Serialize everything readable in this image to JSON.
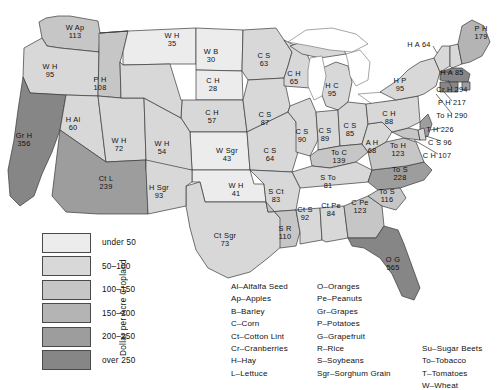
{
  "title": "Dollar per Acre Cropland",
  "legend": {
    "axis_label": "Dollar per Acre Cropland",
    "classes": [
      {
        "label": "under 50",
        "color": "#ececec"
      },
      {
        "label": "50–100",
        "color": "#d8d8d8"
      },
      {
        "label": "100–150",
        "color": "#c6c6c6"
      },
      {
        "label": "150–200",
        "color": "#b4b4b4"
      },
      {
        "label": "200–250",
        "color": "#9d9d9d"
      },
      {
        "label": "over 250",
        "color": "#868686"
      }
    ]
  },
  "crop_key": {
    "column1": [
      "Al–Alfalfa Seed",
      "Ap–Apples",
      "B–Barley",
      "C–Corn",
      "Ct–Cotton Lint",
      "Cr–Cranberries",
      "H–Hay",
      "L–Lettuce"
    ],
    "column2": [
      "O–Oranges",
      "Pe–Peanuts",
      "Gr–Grapes",
      "P–Potatoes",
      "G–Grapefruit",
      "R–Rice",
      "S–Soybeans",
      "Sgr–Sorghum Grain"
    ],
    "column3": [
      "Su–Sugar Beets",
      "To–Tobacco",
      "T–Tomatoes",
      "W–Wheat"
    ]
  },
  "chart_data": {
    "type": "map",
    "title": "Dollar per Acre Cropland",
    "value_unit": "dollars per acre of cropland",
    "classes": [
      "under 50",
      "50-100",
      "100-150",
      "150-200",
      "200-250",
      "over 250"
    ],
    "states": [
      {
        "state": "Washington",
        "crops": "W Ap",
        "value": 113,
        "class": 2,
        "x": 75,
        "y": 32
      },
      {
        "state": "Oregon",
        "crops": "W H",
        "value": 95,
        "class": 1,
        "x": 50,
        "y": 71
      },
      {
        "state": "Idaho",
        "crops": "P H",
        "value": 108,
        "class": 2,
        "x": 100,
        "y": 84
      },
      {
        "state": "Montana",
        "crops": "W H",
        "value": 35,
        "class": 0,
        "x": 172,
        "y": 40
      },
      {
        "state": "North Dakota",
        "crops": "W B",
        "value": 30,
        "class": 0,
        "x": 211,
        "y": 56
      },
      {
        "state": "South Dakota",
        "crops": "C H",
        "value": 28,
        "class": 0,
        "x": 213,
        "y": 85
      },
      {
        "state": "Nebraska",
        "crops": "C H",
        "value": 57,
        "class": 1,
        "x": 212,
        "y": 117
      },
      {
        "state": "Kansas",
        "crops": "W Sgr",
        "value": 43,
        "class": 0,
        "x": 227,
        "y": 155
      },
      {
        "state": "Oklahoma",
        "crops": "W H",
        "value": 41,
        "class": 0,
        "x": 236,
        "y": 190
      },
      {
        "state": "Texas",
        "crops": "Ct Sgr",
        "value": 73,
        "class": 1,
        "x": 225,
        "y": 240
      },
      {
        "state": "Minnesota",
        "crops": "C S",
        "value": 63,
        "class": 1,
        "x": 264,
        "y": 60
      },
      {
        "state": "Iowa",
        "crops": "C S",
        "value": 87,
        "class": 1,
        "x": 265,
        "y": 119
      },
      {
        "state": "Missouri",
        "crops": "C S",
        "value": 64,
        "class": 1,
        "x": 270,
        "y": 155
      },
      {
        "state": "Arkansas",
        "crops": "S Ct",
        "value": 83,
        "class": 1,
        "x": 276,
        "y": 196
      },
      {
        "state": "Louisiana",
        "crops": "S R",
        "value": 110,
        "class": 2,
        "x": 285,
        "y": 233
      },
      {
        "state": "Mississippi",
        "crops": "Ct S",
        "value": 92,
        "class": 1,
        "x": 305,
        "y": 214
      },
      {
        "state": "Alabama",
        "crops": "Ct Pe",
        "value": 84,
        "class": 1,
        "x": 331,
        "y": 210
      },
      {
        "state": "Georgia",
        "crops": "C Pe",
        "value": 123,
        "class": 2,
        "x": 360,
        "y": 207
      },
      {
        "state": "Florida",
        "crops": "O G",
        "value": 565,
        "class": 5,
        "x": 393,
        "y": 264
      },
      {
        "state": "Wisconsin",
        "crops": "C H",
        "value": 65,
        "class": 1,
        "x": 294,
        "y": 78
      },
      {
        "state": "Michigan",
        "crops": "H C",
        "value": 95,
        "class": 1,
        "x": 332,
        "y": 90
      },
      {
        "state": "Illinois",
        "crops": "C S",
        "value": 90,
        "class": 1,
        "x": 302,
        "y": 136
      },
      {
        "state": "Indiana",
        "crops": "C S",
        "value": 89,
        "class": 1,
        "x": 325,
        "y": 135
      },
      {
        "state": "Ohio",
        "crops": "C S",
        "value": 85,
        "class": 1,
        "x": 350,
        "y": 130
      },
      {
        "state": "Kentucky",
        "crops": "To C",
        "value": 139,
        "class": 2,
        "x": 339,
        "y": 157
      },
      {
        "state": "Tennessee",
        "crops": "S To",
        "value": 81,
        "class": 1,
        "x": 328,
        "y": 182
      },
      {
        "state": "West Virginia",
        "crops": "A H",
        "value": 68,
        "class": 1,
        "x": 372,
        "y": 147
      },
      {
        "state": "Virginia",
        "crops": "To H",
        "value": 123,
        "class": 2,
        "x": 398,
        "y": 150
      },
      {
        "state": "North Carolina",
        "crops": "To S",
        "value": 228,
        "class": 4,
        "x": 400,
        "y": 174
      },
      {
        "state": "South Carolina",
        "crops": "To S",
        "value": 116,
        "class": 2,
        "x": 387,
        "y": 196
      },
      {
        "state": "Pennsylvania",
        "crops": "C H",
        "value": 88,
        "class": 1,
        "x": 389,
        "y": 118
      },
      {
        "state": "New York",
        "crops": "H P",
        "value": 95,
        "class": 1,
        "x": 400,
        "y": 85
      },
      {
        "state": "California",
        "crops": "Gr H",
        "value": 356,
        "class": 5,
        "x": 24,
        "y": 140
      },
      {
        "state": "Nevada",
        "crops": "H Al",
        "value": 60,
        "class": 1,
        "x": 73,
        "y": 124
      },
      {
        "state": "Utah",
        "crops": "W H",
        "value": 72,
        "class": 1,
        "x": 119,
        "y": 145
      },
      {
        "state": "Arizona",
        "crops": "Ct L",
        "value": 239,
        "class": 4,
        "x": 106,
        "y": 183
      },
      {
        "state": "New Mexico",
        "crops": "H Sgr",
        "value": 93,
        "class": 1,
        "x": 159,
        "y": 192
      },
      {
        "state": "Colorado",
        "crops": "W H",
        "value": 54,
        "class": 1,
        "x": 162,
        "y": 148
      }
    ],
    "callouts": [
      {
        "state": "Vermont",
        "crops": "H A",
        "value": 64,
        "class": 1,
        "x": 419,
        "y": 45,
        "align": "right"
      },
      {
        "state": "Maine",
        "crops": "P H",
        "value": 179,
        "class": 3,
        "x": 481,
        "y": 33,
        "align": "center"
      },
      {
        "state": "New Hampshire",
        "crops": "H A",
        "value": 85,
        "class": 1,
        "x": 452,
        "y": 73,
        "align": "left"
      },
      {
        "state": "Massachusetts",
        "crops": "Cr H",
        "value": 294,
        "class": 5,
        "x": 452,
        "y": 90,
        "align": "left"
      },
      {
        "state": "Rhode Island",
        "crops": "P H",
        "value": 217,
        "class": 4,
        "x": 452,
        "y": 103,
        "align": "left"
      },
      {
        "state": "Connecticut",
        "crops": "To H",
        "value": 290,
        "class": 5,
        "x": 452,
        "y": 116,
        "align": "left"
      },
      {
        "state": "New Jersey",
        "crops": "T H",
        "value": 226,
        "class": 4,
        "x": 440,
        "y": 130,
        "align": "left"
      },
      {
        "state": "Delaware",
        "crops": "C S",
        "value": 96,
        "class": 1,
        "x": 440,
        "y": 143,
        "align": "left"
      },
      {
        "state": "Maryland",
        "crops": "C H",
        "value": 107,
        "class": 2,
        "x": 437,
        "y": 156,
        "align": "left"
      }
    ]
  }
}
